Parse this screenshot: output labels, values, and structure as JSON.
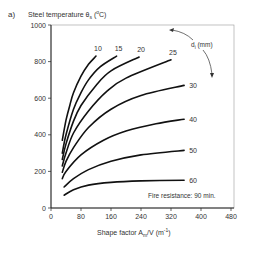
{
  "chart_data": {
    "type": "line",
    "panel_label": "a)",
    "ylabel": "Steel temperature θs (°C)",
    "xlabel": "Shape factor Am/V (m⁻¹)",
    "xlim": [
      0,
      480
    ],
    "ylim": [
      0,
      1000
    ],
    "xticks": [
      0,
      80,
      160,
      240,
      320,
      400,
      480
    ],
    "yticks": [
      0,
      200,
      400,
      600,
      800,
      1000
    ],
    "grid": false,
    "legend_title": "di (mm)",
    "annotation": "Fire resistance: 90 min.",
    "series": [
      {
        "name": "10",
        "points": [
          [
            30,
            370
          ],
          [
            40,
            480
          ],
          [
            50,
            560
          ],
          [
            60,
            630
          ],
          [
            80,
            720
          ],
          [
            100,
            785
          ],
          [
            120,
            830
          ]
        ]
      },
      {
        "name": "15",
        "points": [
          [
            30,
            300
          ],
          [
            40,
            400
          ],
          [
            60,
            540
          ],
          [
            80,
            630
          ],
          [
            100,
            700
          ],
          [
            130,
            770
          ],
          [
            175,
            830
          ]
        ]
      },
      {
        "name": "20",
        "points": [
          [
            30,
            265
          ],
          [
            40,
            350
          ],
          [
            60,
            475
          ],
          [
            80,
            560
          ],
          [
            120,
            670
          ],
          [
            160,
            750
          ],
          [
            235,
            825
          ]
        ]
      },
      {
        "name": "25",
        "points": [
          [
            30,
            230
          ],
          [
            40,
            300
          ],
          [
            60,
            410
          ],
          [
            100,
            530
          ],
          [
            150,
            640
          ],
          [
            200,
            710
          ],
          [
            320,
            810
          ]
        ]
      },
      {
        "name": "30",
        "points": [
          [
            30,
            195
          ],
          [
            40,
            255
          ],
          [
            60,
            330
          ],
          [
            100,
            440
          ],
          [
            160,
            540
          ],
          [
            240,
            615
          ],
          [
            355,
            670
          ]
        ]
      },
      {
        "name": "40",
        "points": [
          [
            30,
            160
          ],
          [
            40,
            200
          ],
          [
            80,
            290
          ],
          [
            140,
            370
          ],
          [
            200,
            420
          ],
          [
            280,
            460
          ],
          [
            355,
            485
          ]
        ]
      },
      {
        "name": "50",
        "points": [
          [
            35,
            115
          ],
          [
            60,
            160
          ],
          [
            100,
            210
          ],
          [
            160,
            255
          ],
          [
            240,
            290
          ],
          [
            355,
            315
          ]
        ]
      },
      {
        "name": "60",
        "points": [
          [
            35,
            70
          ],
          [
            60,
            100
          ],
          [
            100,
            125
          ],
          [
            160,
            140
          ],
          [
            240,
            148
          ],
          [
            355,
            152
          ]
        ]
      }
    ]
  }
}
